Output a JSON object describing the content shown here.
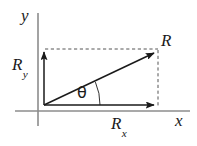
{
  "figure": {
    "background_color": "#ffffff",
    "axis_color": "#8c8c8c",
    "vector_color": "#1a1a1a",
    "dashed_color": "#555555"
  },
  "axes": {
    "x_axis": {
      "label": "x",
      "name": "horizontal-axis",
      "color": "#8c8c8c",
      "y_pixel": 111,
      "x_start": 15,
      "x_end": 190
    },
    "y_axis": {
      "label": "y",
      "name": "vertical-axis",
      "color": "#8c8c8c",
      "x_pixel": 38,
      "y_start": 13,
      "y_end": 126
    }
  },
  "vectors": [
    {
      "id": "resultant",
      "label": "R",
      "name": "resultant-vector",
      "from": [
        44,
        105
      ],
      "to": [
        156,
        52
      ],
      "color": "#1a1a1a"
    },
    {
      "id": "x_component",
      "label": "R",
      "subscript": "x",
      "name": "x-component-vector",
      "from": [
        44,
        105
      ],
      "to": [
        156,
        105
      ],
      "color": "#1a1a1a"
    },
    {
      "id": "y_component",
      "label": "R",
      "subscript": "y",
      "name": "y-component-vector",
      "from": [
        44,
        105
      ],
      "to": [
        44,
        50
      ],
      "color": "#1a1a1a"
    }
  ],
  "guides": [
    {
      "id": "top_dashed",
      "name": "horizontal-dashed-guide",
      "orientation": "horizontal",
      "from": [
        45,
        49
      ],
      "to": [
        158,
        49
      ]
    },
    {
      "id": "right_dashed",
      "name": "vertical-dashed-guide",
      "orientation": "vertical",
      "from": [
        158,
        50
      ],
      "to": [
        158,
        106
      ]
    }
  ],
  "angle": {
    "symbol": "θ",
    "name": "angle-theta",
    "vertex": [
      44,
      105
    ],
    "arc_radius": 56,
    "arc_from_deg": 0,
    "arc_to_deg": 25.3
  },
  "labels": {
    "y_axis": "y",
    "x_axis": "x",
    "resultant": "R",
    "y_component_base": "R",
    "y_component_sub": "y",
    "x_component_base": "R",
    "x_component_sub": "x",
    "theta": "θ"
  }
}
